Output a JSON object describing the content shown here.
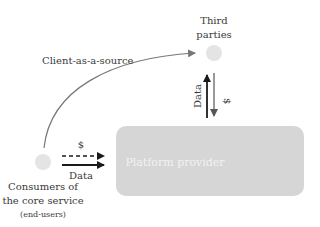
{
  "nodes": {
    "third_parties": {
      "label_line1": "Third",
      "label_line2": "parties"
    },
    "consumers": {
      "label_line1": "Consumers of",
      "label_line2": "the core service",
      "label_line3": "(end-users)"
    },
    "platform": {
      "label": "Platform provider"
    }
  },
  "edges": {
    "client_as_source": {
      "label": "Client-as-a-source"
    },
    "third_party_data": {
      "label": "Data"
    },
    "third_party_money": {
      "label": "$"
    },
    "consumer_money": {
      "label": "$"
    },
    "consumer_data": {
      "label": "Data"
    }
  },
  "colors": {
    "node_fill": "#e4e4e4",
    "platform_fill": "#d6d6d6",
    "platform_text": "#f2f2f2",
    "arrow_dark": "#1a1a1a",
    "arrow_gray": "#555555",
    "curve": "#777777"
  }
}
